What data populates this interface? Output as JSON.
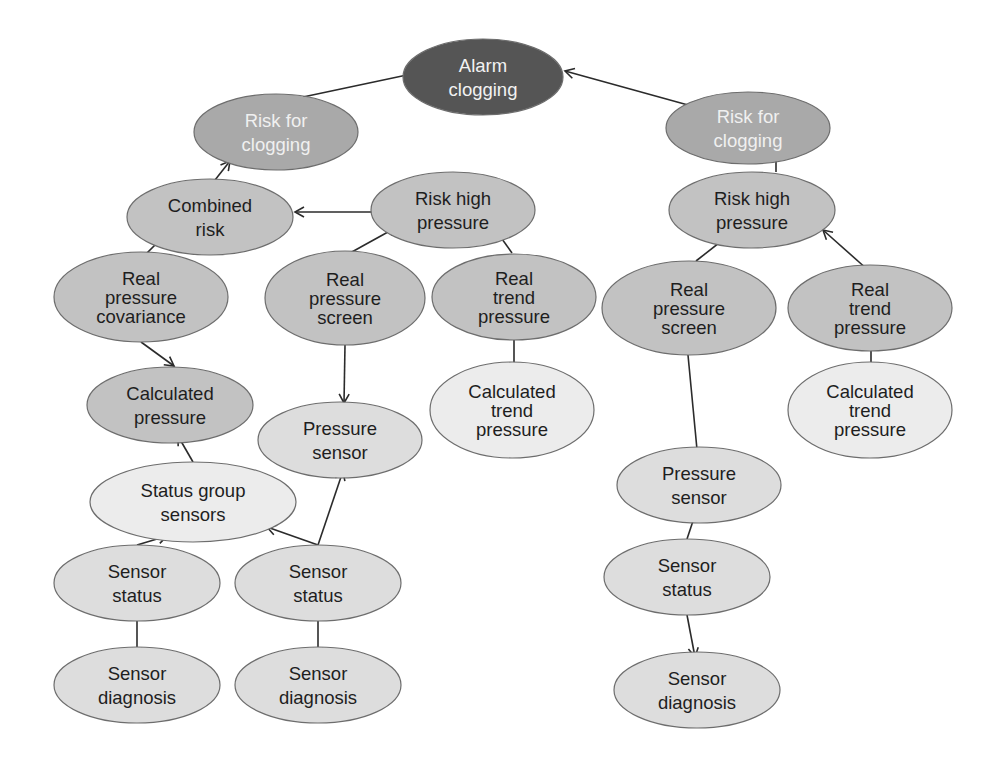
{
  "diagram": {
    "styles": {
      "alarm": {
        "fill": "#555555",
        "text": "#f2f2f2"
      },
      "risk": {
        "fill": "#a9a9a9",
        "text": "#f0f0f0"
      },
      "mid": {
        "fill": "#c2c2c2",
        "text": "#1e1e1e"
      },
      "light": {
        "fill": "#dddddd",
        "text": "#1e1e1e"
      },
      "pale": {
        "fill": "#ececec",
        "text": "#1e1e1e"
      }
    },
    "nodes": [
      {
        "id": "alarm",
        "lines": [
          "Alarm",
          "clogging"
        ],
        "cx": 483,
        "cy": 77,
        "rx": 80,
        "ry": 38,
        "style": "alarm"
      },
      {
        "id": "risk_clog_l",
        "lines": [
          "Risk for",
          "clogging"
        ],
        "cx": 276,
        "cy": 132,
        "rx": 82,
        "ry": 38,
        "style": "risk"
      },
      {
        "id": "risk_clog_r",
        "lines": [
          "Risk for",
          "clogging"
        ],
        "cx": 748,
        "cy": 128,
        "rx": 82,
        "ry": 36,
        "style": "risk"
      },
      {
        "id": "combined_risk",
        "lines": [
          "Combined",
          "risk"
        ],
        "cx": 210,
        "cy": 217,
        "rx": 83,
        "ry": 38,
        "style": "mid"
      },
      {
        "id": "risk_high_l",
        "lines": [
          "Risk high",
          "pressure"
        ],
        "cx": 453,
        "cy": 210,
        "rx": 82,
        "ry": 38,
        "style": "mid"
      },
      {
        "id": "risk_high_r",
        "lines": [
          "Risk high",
          "pressure"
        ],
        "cx": 752,
        "cy": 210,
        "rx": 83,
        "ry": 38,
        "style": "mid"
      },
      {
        "id": "real_cov",
        "lines": [
          "Real",
          "pressure",
          "covariance"
        ],
        "cx": 141,
        "cy": 297,
        "rx": 87,
        "ry": 45,
        "style": "mid"
      },
      {
        "id": "real_screen_l",
        "lines": [
          "Real",
          "pressure",
          "screen"
        ],
        "cx": 345,
        "cy": 298,
        "rx": 80,
        "ry": 47,
        "style": "mid"
      },
      {
        "id": "real_trend_l",
        "lines": [
          "Real",
          "trend",
          "pressure"
        ],
        "cx": 514,
        "cy": 297,
        "rx": 82,
        "ry": 43,
        "style": "mid"
      },
      {
        "id": "real_screen_r",
        "lines": [
          "Real",
          "pressure",
          "screen"
        ],
        "cx": 689,
        "cy": 308,
        "rx": 87,
        "ry": 47,
        "style": "mid"
      },
      {
        "id": "real_trend_r",
        "lines": [
          "Real",
          "trend",
          "pressure"
        ],
        "cx": 870,
        "cy": 308,
        "rx": 82,
        "ry": 43,
        "style": "mid"
      },
      {
        "id": "calc_pressure",
        "lines": [
          "Calculated",
          "pressure"
        ],
        "cx": 170,
        "cy": 405,
        "rx": 83,
        "ry": 38,
        "style": "mid"
      },
      {
        "id": "pressure_sensor_l",
        "lines": [
          "Pressure",
          "sensor"
        ],
        "cx": 340,
        "cy": 440,
        "rx": 82,
        "ry": 38,
        "style": "light"
      },
      {
        "id": "calc_trend_l",
        "lines": [
          "Calculated",
          "trend",
          "pressure"
        ],
        "cx": 512,
        "cy": 410,
        "rx": 82,
        "ry": 48,
        "style": "pale"
      },
      {
        "id": "calc_trend_r",
        "lines": [
          "Calculated",
          "trend",
          "pressure"
        ],
        "cx": 870,
        "cy": 410,
        "rx": 82,
        "ry": 48,
        "style": "pale"
      },
      {
        "id": "status_group",
        "lines": [
          "Status group",
          "sensors"
        ],
        "cx": 193,
        "cy": 502,
        "rx": 103,
        "ry": 40,
        "style": "pale"
      },
      {
        "id": "pressure_sensor_r",
        "lines": [
          "Pressure",
          "sensor"
        ],
        "cx": 699,
        "cy": 485,
        "rx": 82,
        "ry": 38,
        "style": "light"
      },
      {
        "id": "sensor_status_1",
        "lines": [
          "Sensor",
          "status"
        ],
        "cx": 137,
        "cy": 583,
        "rx": 83,
        "ry": 38,
        "style": "light"
      },
      {
        "id": "sensor_status_2",
        "lines": [
          "Sensor",
          "status"
        ],
        "cx": 318,
        "cy": 583,
        "rx": 83,
        "ry": 38,
        "style": "light"
      },
      {
        "id": "sensor_status_r",
        "lines": [
          "Sensor",
          "status"
        ],
        "cx": 687,
        "cy": 577,
        "rx": 83,
        "ry": 38,
        "style": "light"
      },
      {
        "id": "sensor_diag_1",
        "lines": [
          "Sensor",
          "diagnosis"
        ],
        "cx": 137,
        "cy": 685,
        "rx": 83,
        "ry": 38,
        "style": "light"
      },
      {
        "id": "sensor_diag_2",
        "lines": [
          "Sensor",
          "diagnosis"
        ],
        "cx": 318,
        "cy": 685,
        "rx": 83,
        "ry": 38,
        "style": "light"
      },
      {
        "id": "sensor_diag_r",
        "lines": [
          "Sensor",
          "diagnosis"
        ],
        "cx": 697,
        "cy": 690,
        "rx": 83,
        "ry": 38,
        "style": "light"
      }
    ],
    "edges": [
      {
        "from": "risk_clog_l",
        "to": "alarm",
        "x1": 303,
        "y1": 97,
        "x2": 421,
        "y2": 72
      },
      {
        "from": "risk_clog_r",
        "to": "alarm",
        "x1": 688,
        "y1": 105,
        "x2": 565,
        "y2": 71
      },
      {
        "from": "combined_risk",
        "to": "risk_clog_l",
        "x1": 215,
        "y1": 180,
        "x2": 230,
        "y2": 161
      },
      {
        "from": "risk_high_l",
        "to": "combined_risk",
        "x1": 373,
        "y1": 212,
        "x2": 295,
        "y2": 212
      },
      {
        "from": "risk_high_r",
        "to": "risk_clog_r",
        "x1": 776,
        "y1": 172,
        "x2": 776,
        "y2": 148
      },
      {
        "from": "real_cov",
        "to": "combined_risk",
        "x1": 143,
        "y1": 257,
        "x2": 167,
        "y2": 233
      },
      {
        "from": "real_screen_l",
        "to": "risk_high_l",
        "x1": 350,
        "y1": 253,
        "x2": 397,
        "y2": 227
      },
      {
        "from": "real_trend_l",
        "to": "risk_high_l",
        "x1": 512,
        "y1": 253,
        "x2": 492,
        "y2": 225
      },
      {
        "from": "real_screen_r",
        "to": "risk_high_r",
        "x1": 696,
        "y1": 261,
        "x2": 733,
        "y2": 232
      },
      {
        "from": "real_trend_r",
        "to": "risk_high_r",
        "x1": 868,
        "y1": 270,
        "x2": 823,
        "y2": 230
      },
      {
        "from": "real_cov",
        "to": "calc_pressure",
        "x1": 141,
        "y1": 342,
        "x2": 174,
        "y2": 366
      },
      {
        "from": "real_screen_l",
        "to": "pressure_sensor_l",
        "x1": 345,
        "y1": 345,
        "x2": 344,
        "y2": 403
      },
      {
        "from": "real_trend_l",
        "to": "calc_trend_l",
        "x1": 514,
        "y1": 340,
        "x2": 514,
        "y2": 377
      },
      {
        "from": "real_screen_r",
        "to": "pressure_sensor_r",
        "x1": 688,
        "y1": 355,
        "x2": 698,
        "y2": 460
      },
      {
        "from": "real_trend_r",
        "to": "calc_trend_r",
        "x1": 871,
        "y1": 350,
        "x2": 871,
        "y2": 377
      },
      {
        "from": "status_group",
        "to": "calc_pressure",
        "x1": 193,
        "y1": 462,
        "x2": 178,
        "y2": 436
      },
      {
        "from": "sensor_status_1",
        "to": "status_group",
        "x1": 137,
        "y1": 545,
        "x2": 167,
        "y2": 536
      },
      {
        "from": "sensor_status_2",
        "to": "status_group",
        "x1": 318,
        "y1": 545,
        "x2": 267,
        "y2": 527
      },
      {
        "from": "sensor_status_2",
        "to": "pressure_sensor_l",
        "x1": 318,
        "y1": 545,
        "x2": 343,
        "y2": 471
      },
      {
        "from": "sensor_status_1",
        "to": "sensor_diag_1",
        "x1": 137,
        "y1": 621,
        "x2": 137,
        "y2": 657
      },
      {
        "from": "sensor_status_2",
        "to": "sensor_diag_2",
        "x1": 318,
        "y1": 621,
        "x2": 318,
        "y2": 657
      },
      {
        "from": "sensor_status_r",
        "to": "pressure_sensor_r",
        "x1": 687,
        "y1": 539,
        "x2": 700,
        "y2": 500
      },
      {
        "from": "sensor_status_r",
        "to": "sensor_diag_r",
        "x1": 687,
        "y1": 615,
        "x2": 695,
        "y2": 657
      }
    ]
  }
}
